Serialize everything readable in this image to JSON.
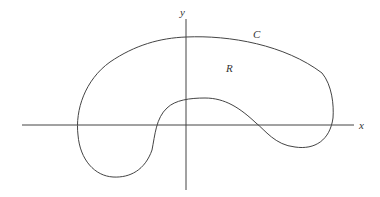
{
  "diagram": {
    "axes": {
      "x_label": "x",
      "y_label": "y"
    },
    "curve_label": "C",
    "region_label": "R",
    "stroke_color": "#444444",
    "background": "#ffffff"
  }
}
